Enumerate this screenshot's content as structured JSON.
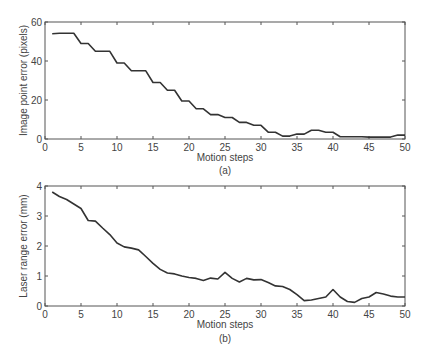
{
  "chart_data": [
    {
      "type": "line",
      "panel": "(a)",
      "title": "",
      "xlabel": "Motion steps",
      "ylabel": "Image point error (pixels)",
      "caption": "(a)",
      "xlim": [
        0,
        50
      ],
      "ylim": [
        0,
        60
      ],
      "xticks": [
        0,
        5,
        10,
        15,
        20,
        25,
        30,
        35,
        40,
        45,
        50
      ],
      "yticks": [
        0,
        20,
        40,
        60
      ],
      "grid": false,
      "x": [
        1,
        2,
        3,
        4,
        5,
        6,
        7,
        8,
        9,
        10,
        11,
        12,
        13,
        14,
        15,
        16,
        17,
        18,
        19,
        20,
        21,
        22,
        23,
        24,
        25,
        26,
        27,
        28,
        29,
        30,
        31,
        32,
        33,
        34,
        35,
        36,
        37,
        38,
        39,
        40,
        41,
        42,
        43,
        44,
        45,
        46,
        47,
        48,
        49,
        50
      ],
      "values": [
        54,
        54.2,
        54.2,
        54.2,
        49,
        49,
        45,
        45,
        45,
        39,
        39,
        35,
        35,
        35,
        29,
        29,
        25,
        25,
        19.5,
        19.5,
        15.5,
        15.5,
        12.5,
        12.5,
        11,
        11,
        8.5,
        8.5,
        7,
        7,
        3.5,
        3.5,
        1.5,
        1.5,
        2.5,
        2.5,
        4.5,
        4.5,
        3.5,
        3.5,
        1.2,
        1.2,
        1.2,
        1.2,
        1,
        1,
        1,
        1,
        2,
        2
      ]
    },
    {
      "type": "line",
      "panel": "(b)",
      "title": "",
      "xlabel": "Motion steps",
      "ylabel": "Laser range error (mm)",
      "caption": "(b)",
      "xlim": [
        0,
        50
      ],
      "ylim": [
        0,
        4
      ],
      "xticks": [
        0,
        5,
        10,
        15,
        20,
        25,
        30,
        35,
        40,
        45,
        50
      ],
      "yticks": [
        0,
        1,
        2,
        3,
        4
      ],
      "grid": false,
      "x": [
        1,
        2,
        3,
        4,
        5,
        6,
        7,
        8,
        9,
        10,
        11,
        12,
        13,
        14,
        15,
        16,
        17,
        18,
        19,
        20,
        21,
        22,
        23,
        24,
        25,
        26,
        27,
        28,
        29,
        30,
        31,
        32,
        33,
        34,
        35,
        36,
        37,
        38,
        39,
        40,
        41,
        42,
        43,
        44,
        45,
        46,
        47,
        48,
        49,
        50
      ],
      "values": [
        3.8,
        3.65,
        3.55,
        3.4,
        3.25,
        2.85,
        2.83,
        2.6,
        2.38,
        2.1,
        1.97,
        1.93,
        1.87,
        1.65,
        1.42,
        1.22,
        1.1,
        1.07,
        1.0,
        0.95,
        0.92,
        0.85,
        0.93,
        0.9,
        1.12,
        0.92,
        0.8,
        0.92,
        0.87,
        0.88,
        0.78,
        0.67,
        0.65,
        0.55,
        0.38,
        0.18,
        0.2,
        0.25,
        0.3,
        0.55,
        0.3,
        0.15,
        0.12,
        0.25,
        0.3,
        0.45,
        0.4,
        0.33,
        0.3,
        0.3
      ]
    }
  ]
}
